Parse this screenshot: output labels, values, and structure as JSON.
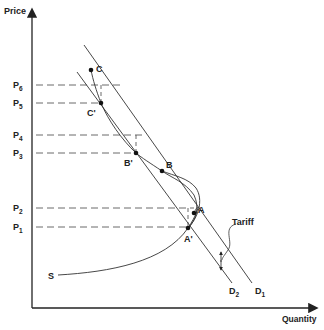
{
  "diagram": {
    "axes": {
      "y_label": "Price",
      "x_label": "Quantity"
    },
    "price_levels": [
      {
        "id": "P6",
        "base": "P",
        "sub": "6",
        "y": 85,
        "x_end": 122
      },
      {
        "id": "P5",
        "base": "P",
        "sub": "5",
        "y": 103,
        "x_end": 101
      },
      {
        "id": "P4",
        "base": "P",
        "sub": "4",
        "y": 135,
        "x_end": 145
      },
      {
        "id": "P3",
        "base": "P",
        "sub": "3",
        "y": 153,
        "x_end": 136
      },
      {
        "id": "P2",
        "base": "P",
        "sub": "2",
        "y": 208,
        "x_end": 194
      },
      {
        "id": "P1",
        "base": "P",
        "sub": "1",
        "y": 227,
        "x_end": 188
      }
    ],
    "points": [
      {
        "id": "C",
        "label": "C",
        "x": 91,
        "y": 70,
        "lx": 96,
        "ly": 72
      },
      {
        "id": "C'",
        "label": "C'",
        "x": 101,
        "y": 103,
        "lx": 87,
        "ly": 116
      },
      {
        "id": "B'",
        "label": "B'",
        "x": 136,
        "y": 153,
        "lx": 124,
        "ly": 166
      },
      {
        "id": "B",
        "label": "B",
        "x": 162,
        "y": 171,
        "lx": 166,
        "ly": 168
      },
      {
        "id": "A",
        "label": "A",
        "x": 194,
        "y": 213,
        "lx": 198,
        "ly": 213
      },
      {
        "id": "A'",
        "label": "A'",
        "x": 188,
        "y": 228,
        "lx": 184,
        "ly": 242
      }
    ],
    "demand_curves": [
      {
        "id": "D1",
        "base": "D",
        "sub": "1",
        "x1": 84,
        "y1": 45,
        "x2": 252,
        "y2": 283,
        "lx": 255,
        "ly": 294
      },
      {
        "id": "D2",
        "base": "D",
        "sub": "2",
        "x1": 77,
        "y1": 72,
        "x2": 232,
        "y2": 283,
        "lx": 229,
        "ly": 294
      }
    ],
    "supply_curve": {
      "label": "S",
      "lx": 48,
      "ly": 279
    },
    "annotations": {
      "tariff_label": "Tariff"
    }
  }
}
